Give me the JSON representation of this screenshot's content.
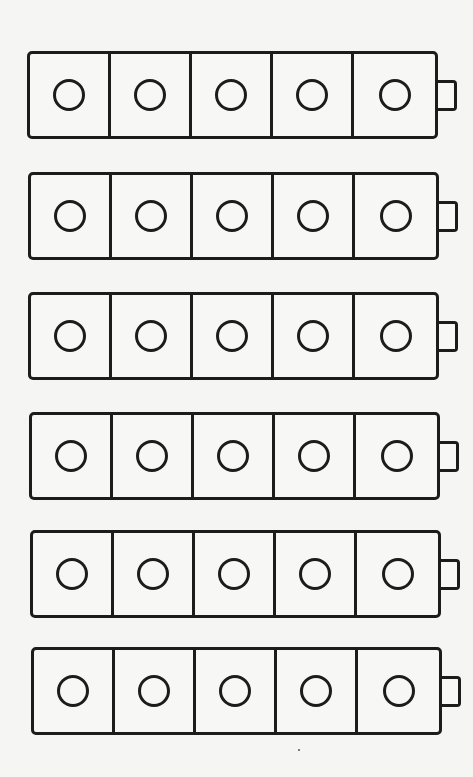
{
  "diagram": {
    "type": "connecting-cube trains",
    "rows": 6,
    "cubes_per_row": 5,
    "total_cubes": 30,
    "cube_feature": "circle",
    "connector": "nub on right end of each train",
    "colors": {
      "stroke": "#1c1c1c",
      "fill": "#f7f7f6",
      "background": "#f5f5f3"
    },
    "trains": [
      {
        "label": "",
        "top": 51,
        "left": 27,
        "cubes": 5
      },
      {
        "label": "",
        "top": 172,
        "left": 28,
        "cubes": 5
      },
      {
        "label": "",
        "top": 292,
        "left": 28,
        "cubes": 5
      },
      {
        "label": "",
        "top": 412,
        "left": 29,
        "cubes": 5
      },
      {
        "label": "",
        "top": 530,
        "left": 30,
        "cubes": 5
      },
      {
        "label": "",
        "top": 647,
        "left": 31,
        "cubes": 5
      }
    ]
  }
}
